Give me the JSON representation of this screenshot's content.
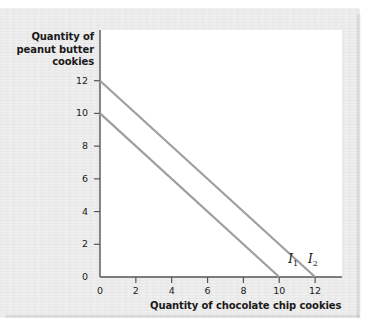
{
  "chart_data": {
    "type": "line",
    "title": "",
    "xlabel": "Quantity of chocolate chip cookies",
    "ylabel": "Quantity of peanut butter cookies",
    "ylabel_lines": [
      "Quantity of",
      "peanut butter",
      "cookies"
    ],
    "xlim": [
      0,
      13.5
    ],
    "ylim": [
      0,
      15.1
    ],
    "xticks": [
      0,
      2,
      4,
      6,
      8,
      10,
      12
    ],
    "yticks": [
      0,
      2,
      4,
      6,
      8,
      10,
      12
    ],
    "xtick_labels": [
      "0",
      "2",
      "4",
      "6",
      "8",
      "10",
      "12"
    ],
    "ytick_labels": [
      "0",
      "2",
      "4",
      "6",
      "8",
      "10",
      "12"
    ],
    "grid": false,
    "legend": "none",
    "line_color": "#9e9e9e",
    "axis_color": "#555555",
    "plot_background": "#ffffff",
    "page_background": "#e9e9e9",
    "series": [
      {
        "name": "I1",
        "label": "I",
        "label_sub": "1",
        "points": [
          [
            0,
            10
          ],
          [
            10,
            0
          ]
        ],
        "x_intercept": 10,
        "y_intercept": 10,
        "slope": -1,
        "label_x": 10.5,
        "label_y": 1.0
      },
      {
        "name": "I2",
        "label": "I",
        "label_sub": "2",
        "points": [
          [
            0,
            12
          ],
          [
            12,
            0
          ]
        ],
        "x_intercept": 12,
        "y_intercept": 12,
        "slope": -1,
        "label_x": 11.6,
        "label_y": 1.0
      }
    ]
  }
}
